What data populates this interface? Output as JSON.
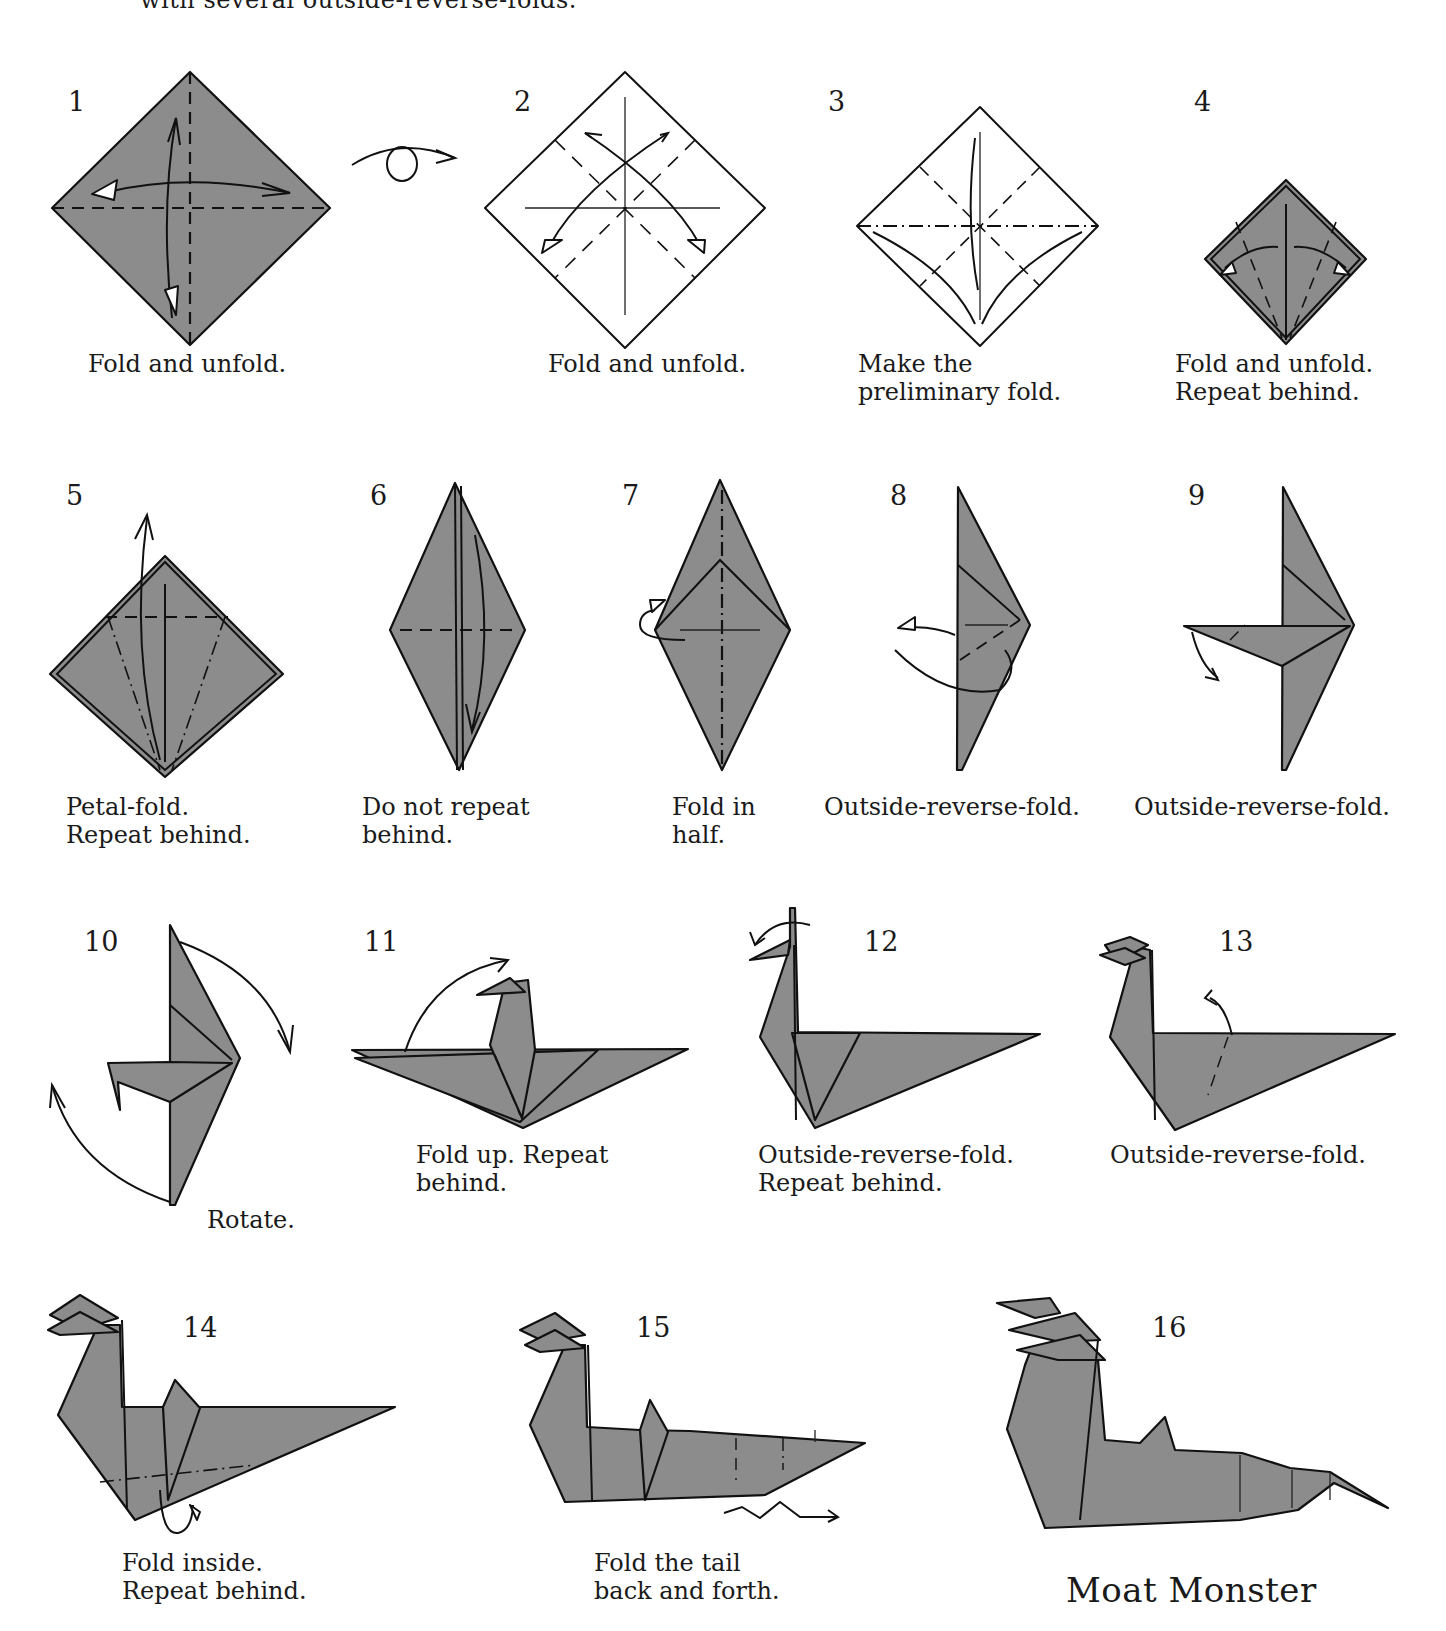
{
  "intro_fragment": "with several outside-reverse-folds.",
  "title": "Moat Monster",
  "colors": {
    "paper_colored": "#8c8c8c",
    "paper_white": "#ffffff",
    "line": "#111111"
  },
  "steps": [
    {
      "number": "1",
      "caption": "Fold and unfold."
    },
    {
      "number": "2",
      "caption": "Fold and unfold."
    },
    {
      "number": "3",
      "caption": "Make the\npreliminary fold."
    },
    {
      "number": "4",
      "caption": "Fold and unfold.\nRepeat behind."
    },
    {
      "number": "5",
      "caption": "Petal-fold.\nRepeat behind."
    },
    {
      "number": "6",
      "caption": "Do not repeat\nbehind."
    },
    {
      "number": "7",
      "caption": "Fold in\nhalf."
    },
    {
      "number": "8",
      "caption": "Outside-reverse-fold."
    },
    {
      "number": "9",
      "caption": "Outside-reverse-fold."
    },
    {
      "number": "10",
      "caption": "Rotate."
    },
    {
      "number": "11",
      "caption": "Fold up. Repeat\nbehind."
    },
    {
      "number": "12",
      "caption": "Outside-reverse-fold.\nRepeat behind."
    },
    {
      "number": "13",
      "caption": "Outside-reverse-fold."
    },
    {
      "number": "14",
      "caption": "Fold inside.\nRepeat behind."
    },
    {
      "number": "15",
      "caption": "Fold the tail\nback and forth."
    },
    {
      "number": "16",
      "caption": ""
    }
  ],
  "symbols": {
    "turn_over": "turn-over-arrow",
    "valley_fold": "dashed-line",
    "mountain_fold": "dash-dot-line"
  }
}
